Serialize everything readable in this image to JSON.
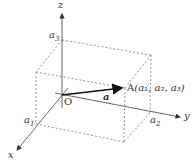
{
  "diagram": {
    "axes": {
      "x": "x",
      "y": "y",
      "z": "z"
    },
    "origin_label": "O",
    "point_label": "A",
    "point_coords": "(a₁, a₂, a₃)",
    "vector_label": "a",
    "tick_labels": {
      "a1": "a",
      "a1_sub": "1",
      "a2": "a",
      "a2_sub": "2",
      "a3": "a",
      "a3_sub": "3"
    },
    "colors": {
      "axis": "#555555",
      "dashed": "#777777",
      "vector": "#111111"
    }
  }
}
